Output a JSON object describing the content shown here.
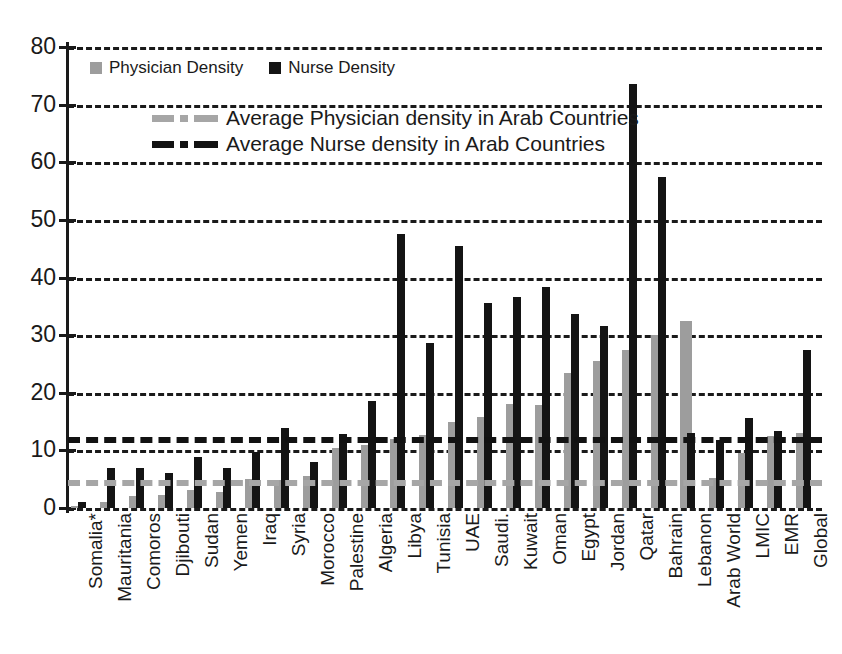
{
  "chart_data": {
    "type": "bar",
    "title": "",
    "xlabel": "",
    "ylabel": "",
    "ylim": [
      0,
      80
    ],
    "yticks": [
      0,
      10,
      20,
      30,
      40,
      50,
      60,
      70,
      80
    ],
    "grid": true,
    "legend_position": "inside-top-left",
    "categories": [
      "Somalia*",
      "Mauritania",
      "Comoros",
      "Djibouti",
      "Sudan",
      "Yemen",
      "Iraq",
      "Syria",
      "Morocco",
      "Palestine",
      "Algeria",
      "Libya",
      "Tunisia",
      "UAE",
      "Saudi.",
      "Kuwait",
      "Oman",
      "Egypt",
      "Jordan",
      "Qatar",
      "Bahrain",
      "Lebanon",
      "Arab World",
      "LMIC",
      "EMR",
      "Global"
    ],
    "series": [
      {
        "name": "Physician Density",
        "color": "#9d9d9d",
        "values": [
          0.3,
          1.0,
          2.0,
          2.2,
          3.2,
          2.7,
          5.0,
          4.9,
          5.5,
          10.5,
          11.0,
          12.0,
          12.7,
          15.0,
          15.8,
          18.0,
          17.8,
          23.5,
          25.5,
          27.5,
          30.0,
          32.5,
          5.2,
          9.5,
          12.5,
          13.0
        ]
      },
      {
        "name": "Nurse Density",
        "color": "#141414",
        "values": [
          1.1,
          7.0,
          7.0,
          6.0,
          8.9,
          7.0,
          9.8,
          13.8,
          8.0,
          12.8,
          18.6,
          47.5,
          28.6,
          45.5,
          35.5,
          36.7,
          38.4,
          33.6,
          31.6,
          73.5,
          57.5,
          13.0,
          11.8,
          15.6,
          13.3,
          27.5
        ]
      }
    ],
    "reference_lines": [
      {
        "label": "Average Physician density in Arab Countries",
        "value": 4.8,
        "color": "#a6a6a6",
        "style": "dash-dot"
      },
      {
        "label": "Average Nurse density in Arab Countries",
        "value": 12.4,
        "color": "#121212",
        "style": "dash-dot"
      }
    ]
  },
  "legend": {
    "series": [
      {
        "label": "Physician Density",
        "swatch": "physician-swatch"
      },
      {
        "label": "Nurse Density",
        "swatch": "nurse-swatch"
      }
    ],
    "averages": [
      {
        "label": "Average Physician density in Arab Countries"
      },
      {
        "label": "Average Nurse density in Arab Countries"
      }
    ]
  },
  "axis": {
    "y_tick_labels": [
      "80",
      "70",
      "60",
      "50",
      "40",
      "30",
      "20",
      "10",
      "0"
    ]
  }
}
